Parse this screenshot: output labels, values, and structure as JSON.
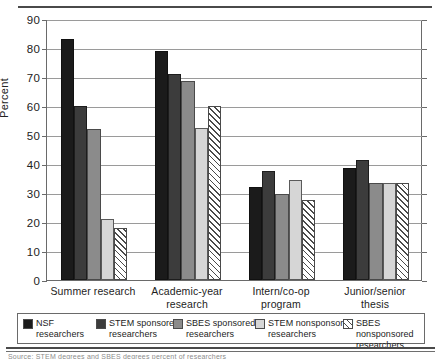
{
  "chart_data": {
    "type": "bar",
    "title": "",
    "xlabel": "",
    "ylabel": "Percent",
    "ylim": [
      0,
      90
    ],
    "ytick_step": 10,
    "yticks": [
      "0",
      "10",
      "20",
      "30",
      "40",
      "50",
      "60",
      "70",
      "80",
      "90"
    ],
    "grid": true,
    "legend_position": "bottom",
    "categories": [
      "Summer research",
      "Academic-year research",
      "Intern/co-op program",
      "Junior/senior thesis"
    ],
    "category_lines": [
      [
        "Summer research",
        ""
      ],
      [
        "Academic-year",
        "research"
      ],
      [
        "Intern/co-op",
        "program"
      ],
      [
        "Junior/senior",
        "thesis"
      ]
    ],
    "series": [
      {
        "name": "NSF researchers",
        "name_lines": [
          "NSF",
          "researchers"
        ],
        "color": "#1b1b1b",
        "pattern": "solid",
        "values": [
          83,
          79,
          32,
          38.5
        ]
      },
      {
        "name": "STEM sponsored researchers",
        "name_lines": [
          "STEM sponsored",
          "researchers"
        ],
        "color": "#3c3c3c",
        "pattern": "solid",
        "values": [
          60,
          71,
          37.5,
          41.5
        ]
      },
      {
        "name": "SBES sponsored researchers",
        "name_lines": [
          "SBES sponsored",
          "researchers"
        ],
        "color": "#8b8b8b",
        "pattern": "solid",
        "values": [
          52,
          68.5,
          29.5,
          33.5
        ]
      },
      {
        "name": "STEM nonsponsored researchers",
        "name_lines": [
          "STEM nonsponsored",
          "researchers"
        ],
        "color": "#d6d6d6",
        "pattern": "solid",
        "values": [
          21,
          52.5,
          34.5,
          33.5
        ]
      },
      {
        "name": "SBES nonsponsored researchers",
        "name_lines": [
          "SBES nonsponsored",
          "researchers"
        ],
        "color": "#ffffff",
        "pattern": "diagonal-hatch",
        "values": [
          18,
          60,
          27.5,
          33.5
        ]
      }
    ]
  },
  "figure": {
    "source_note": "Source:  STEM degrees and SBES degrees    percent of researchers"
  }
}
